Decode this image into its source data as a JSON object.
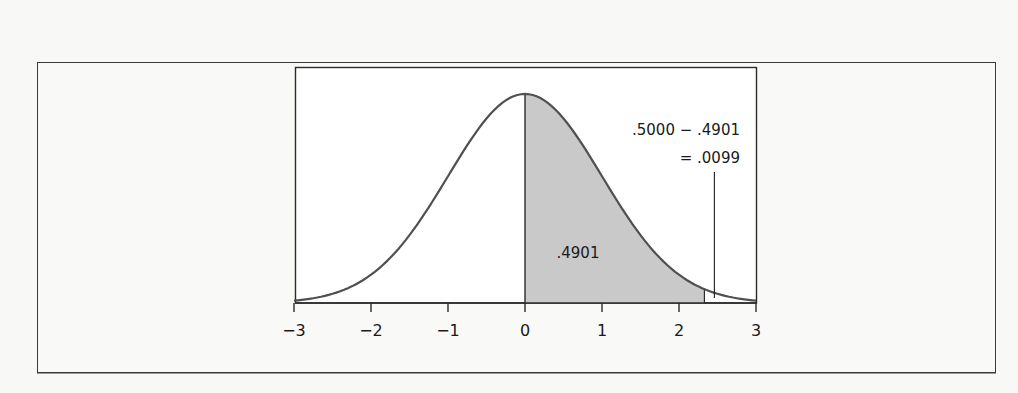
{
  "chart_data": {
    "type": "area",
    "title": "",
    "xlabel": "",
    "ylabel": "",
    "distribution": "standard normal",
    "xlim": [
      -3,
      3
    ],
    "x_ticks": [
      -3,
      -2,
      -1,
      0,
      1,
      2,
      3
    ],
    "x_tick_labels": [
      "−3",
      "−2",
      "−1",
      "0",
      "1",
      "2",
      "3"
    ],
    "shaded_region": {
      "from": 0,
      "to": 2.33,
      "area": 0.4901,
      "label": ".4901"
    },
    "tail_region": {
      "from": 2.33,
      "to": 3,
      "area": 0.0099
    },
    "annotation": {
      "line1": ".5000 − .4901",
      "line2": "= .0099",
      "pointer_x": 2.46
    },
    "grid": false,
    "legend": null
  },
  "colors": {
    "curve": "#505050",
    "shade": "#c9c9c9",
    "axis": "#2a2a2a",
    "plot_background": "#ffffff"
  }
}
